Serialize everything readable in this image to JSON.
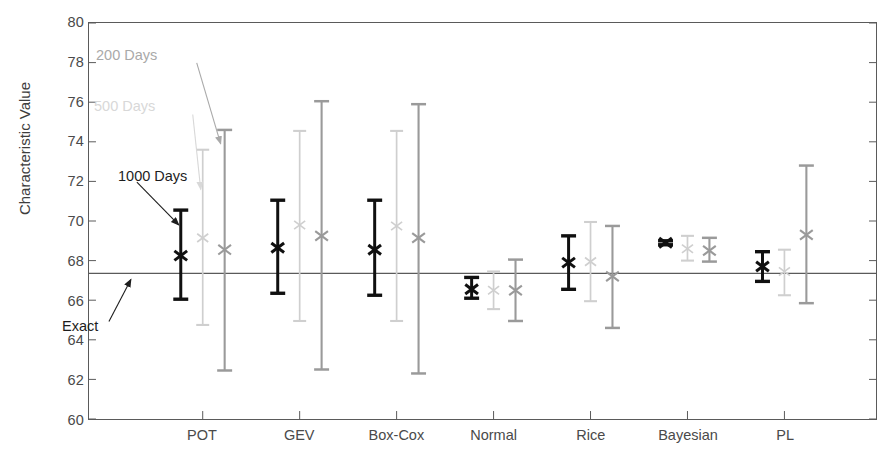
{
  "chart_data": {
    "type": "bar",
    "subtype": "grouped-error-bars",
    "title": "",
    "xlabel": "",
    "ylabel": "Characteristic Value",
    "ylim": [
      60,
      80
    ],
    "ytick_step": 2,
    "yticks": [
      80,
      78,
      76,
      74,
      72,
      70,
      68,
      66,
      64,
      62,
      60
    ],
    "grid": false,
    "legend_position": "in-plot-annotations",
    "categories": [
      "POT",
      "GEV",
      "Box-Cox",
      "Normal",
      "Rice",
      "Bayesian",
      "PL"
    ],
    "reference_line": {
      "label": "Exact",
      "value": 67.35,
      "color": "#5a5a5a"
    },
    "series": [
      {
        "name": "1000 Days",
        "color": "#101010",
        "marker": "x",
        "points": [
          {
            "category": "POT",
            "value": 68.25,
            "low": 66.05,
            "high": 70.55
          },
          {
            "category": "GEV",
            "value": 68.65,
            "low": 66.35,
            "high": 71.05
          },
          {
            "category": "Box-Cox",
            "value": 68.55,
            "low": 66.25,
            "high": 71.05
          },
          {
            "category": "Normal",
            "value": 66.55,
            "low": 66.1,
            "high": 67.15
          },
          {
            "category": "Rice",
            "value": 67.9,
            "low": 66.55,
            "high": 69.25
          },
          {
            "category": "Bayesian",
            "value": 68.9,
            "low": 68.8,
            "high": 69.0
          },
          {
            "category": "PL",
            "value": 67.7,
            "low": 66.95,
            "high": 68.45
          }
        ]
      },
      {
        "name": "500 Days",
        "color": "#cfcfcf",
        "marker": "x",
        "points": [
          {
            "category": "POT",
            "value": 69.15,
            "low": 64.75,
            "high": 73.6
          },
          {
            "category": "GEV",
            "value": 69.8,
            "low": 64.95,
            "high": 74.55
          },
          {
            "category": "Box-Cox",
            "value": 69.75,
            "low": 64.95,
            "high": 74.55
          },
          {
            "category": "Normal",
            "value": 66.5,
            "low": 65.55,
            "high": 67.45
          },
          {
            "category": "Rice",
            "value": 67.95,
            "low": 65.95,
            "high": 69.95
          },
          {
            "category": "Bayesian",
            "value": 68.6,
            "low": 68.0,
            "high": 69.25
          },
          {
            "category": "PL",
            "value": 67.45,
            "low": 66.25,
            "high": 68.55
          }
        ]
      },
      {
        "name": "200 Days",
        "color": "#9a9a9a",
        "marker": "x",
        "points": [
          {
            "category": "POT",
            "value": 68.55,
            "low": 62.45,
            "high": 74.6
          },
          {
            "category": "GEV",
            "value": 69.25,
            "low": 62.5,
            "high": 76.05
          },
          {
            "category": "Box-Cox",
            "value": 69.15,
            "low": 62.3,
            "high": 75.9
          },
          {
            "category": "Normal",
            "value": 66.5,
            "low": 64.95,
            "high": 68.05
          },
          {
            "category": "Rice",
            "value": 67.2,
            "low": 64.6,
            "high": 69.75
          },
          {
            "category": "Bayesian",
            "value": 68.5,
            "low": 67.95,
            "high": 69.15
          },
          {
            "category": "PL",
            "value": 69.3,
            "low": 65.85,
            "high": 72.8
          }
        ]
      }
    ],
    "annotations": [
      {
        "id": "annot-200",
        "text": "200 Days",
        "color": "#a9a9a9"
      },
      {
        "id": "annot-500",
        "text": "500 Days",
        "color": "#d8d8d8"
      },
      {
        "id": "annot-1000",
        "text": "1000 Days",
        "color": "#1d1d1d"
      },
      {
        "id": "annot-exact",
        "text": "Exact",
        "color": "#1d1d1d"
      }
    ]
  }
}
